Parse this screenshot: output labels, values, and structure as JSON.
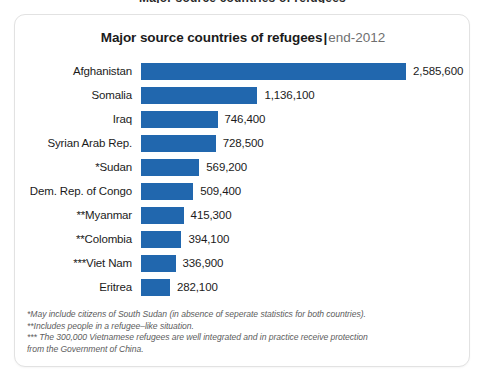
{
  "page": {
    "clipped_header_text": "Major source countries of refugees"
  },
  "card": {
    "title_main": "Major source countries of refugees",
    "title_separator": "|",
    "title_sub": "end-2012"
  },
  "footnotes": {
    "line1": "*May include citizens of South Sudan (in absence of seperate statistics for both countries).",
    "line2": "**Includes people in a refugee–like situation.",
    "line3": "*** The 300,000 Vietnamese refugees are well integrated and in practice receive protection",
    "line4": "from the Government of China."
  },
  "colors": {
    "bar": "#2167ae",
    "text": "#1b1b1b",
    "muted": "#6f6f6f",
    "card_border": "#e2e2e2"
  },
  "chart_data": {
    "type": "bar",
    "orientation": "horizontal",
    "xlabel": "",
    "ylabel": "",
    "grid": false,
    "legend": false,
    "xlim": [
      0,
      2585600
    ],
    "categories": [
      "Afghanistan",
      "Somalia",
      "Iraq",
      "Syrian Arab Rep.",
      "*Sudan",
      "Dem. Rep. of Congo",
      "**Myanmar",
      "**Colombia",
      "***Viet Nam",
      "Eritrea"
    ],
    "values": [
      2585600,
      1136100,
      746400,
      728500,
      569200,
      509400,
      415300,
      394100,
      336900,
      282100
    ],
    "value_labels": [
      "2,585,600",
      "1,136,100",
      "746,400",
      "728,500",
      "569,200",
      "509,400",
      "415,300",
      "394,100",
      "336,900",
      "282,100"
    ]
  }
}
